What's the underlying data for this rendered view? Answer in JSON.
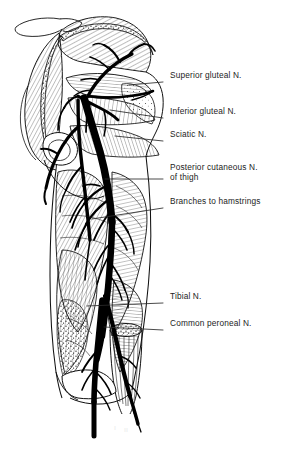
{
  "figure": {
    "view": "posterior dissection of right gluteal region and thigh",
    "background_color": "#ffffff",
    "ink_color": "#000000",
    "label_color": "#1c1c1c",
    "leader_color": "#2b2b2b"
  },
  "labels": [
    {
      "id": "superior-gluteal",
      "text": "Superior gluteal N.",
      "text_x": 170,
      "text_y": 76,
      "leader": {
        "x1": 163,
        "y1": 82,
        "x2": 129,
        "y2": 85
      },
      "target": "superior gluteal nerve emerging above piriformis"
    },
    {
      "id": "inferior-gluteal",
      "text": "Inferior gluteal N.",
      "text_x": 170,
      "text_y": 112,
      "leader": {
        "x1": 163,
        "y1": 118,
        "x2": 110,
        "y2": 110
      },
      "target": "inferior gluteal nerve below piriformis"
    },
    {
      "id": "sciatic",
      "text": "Sciatic N.",
      "text_x": 170,
      "text_y": 135,
      "leader": {
        "x1": 163,
        "y1": 141,
        "x2": 115,
        "y2": 136
      },
      "target": "sciatic nerve trunk"
    },
    {
      "id": "posterior-cutaneous",
      "text": "Posterior cutaneous N.\nof thigh",
      "line1": "Posterior cutaneous N.",
      "line2": "of thigh",
      "text_x": 170,
      "text_y": 168,
      "leader": {
        "x1": 163,
        "y1": 179,
        "x2": 105,
        "y2": 179
      },
      "target": "posterior cutaneous nerve of thigh"
    },
    {
      "id": "branches-hamstrings",
      "text": "Branches to hamstrings",
      "text_x": 170,
      "text_y": 202,
      "leader": {
        "x1": 163,
        "y1": 208,
        "x2": 92,
        "y2": 219
      },
      "target": "muscular branches to hamstring muscles"
    },
    {
      "id": "tibial",
      "text": "Tibial N.",
      "text_x": 170,
      "text_y": 297,
      "leader": {
        "x1": 163,
        "y1": 303,
        "x2": 87,
        "y2": 306
      },
      "target": "tibial nerve"
    },
    {
      "id": "common-peroneal",
      "text": "Common peroneal N.",
      "text_x": 170,
      "text_y": 324,
      "leader": {
        "x1": 163,
        "y1": 330,
        "x2": 104,
        "y2": 327
      },
      "target": "common peroneal nerve"
    }
  ],
  "structures": [
    {
      "name": "iliac-crest-flap",
      "kind": "reflected skin flap",
      "region": "upper left"
    },
    {
      "name": "gluteus-maximus-cut-edge",
      "kind": "stippled cut muscle edge",
      "region": "upper, arching band"
    },
    {
      "name": "gluteus-medius",
      "kind": "hatched muscle",
      "region": "upper gluteal"
    },
    {
      "name": "piriformis",
      "kind": "hatched muscle band",
      "region": "mid gluteal"
    },
    {
      "name": "gluteus-maximus-reflected",
      "kind": "hatched muscle flap",
      "region": "left lateral"
    },
    {
      "name": "ischial-tuberosity",
      "kind": "bone outline",
      "region": "mid left"
    },
    {
      "name": "hamstring-muscles",
      "kind": "hatched muscle bellies",
      "region": "posterior thigh"
    },
    {
      "name": "stippled-fat-pad",
      "kind": "stippled tissue",
      "region": "lower thigh medial"
    },
    {
      "name": "cut-muscle-stump",
      "kind": "stippled cut end",
      "region": "lower right"
    },
    {
      "name": "sciatic-nerve-trunk",
      "kind": "thick black nerve",
      "region": "center, full length"
    },
    {
      "name": "tibial-nerve",
      "kind": "black nerve",
      "region": "lower center"
    },
    {
      "name": "common-peroneal-nerve",
      "kind": "black nerve",
      "region": "lower center-right"
    }
  ],
  "ghost_marks": [
    {
      "text": "ı",
      "x": 114,
      "y": 430
    },
    {
      "text": "ıı",
      "x": 124,
      "y": 432
    }
  ]
}
